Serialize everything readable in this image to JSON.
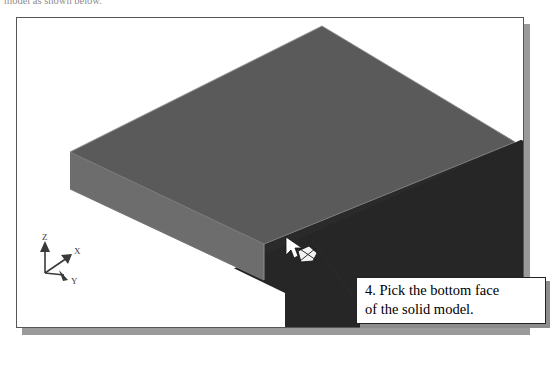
{
  "page": {
    "width": 554,
    "height": 369,
    "background": "#ffffff"
  },
  "top_caption": {
    "text": "model as shown below.",
    "note": "clipped at top edge of screenshot"
  },
  "figure": {
    "frame": {
      "border_color": "#565656",
      "background": "#ffffff",
      "shadow_color": "#9a9a9a"
    },
    "viewport_label": "3D solid model viewport"
  },
  "model": {
    "name": "rectangular solid block",
    "faces": [
      {
        "name": "top-face",
        "color": "#5a5a5a"
      },
      {
        "name": "front-left-side-face",
        "color": "#6b6b6b"
      },
      {
        "name": "front-right-side-face",
        "color": "#3a3a3a"
      },
      {
        "name": "bottom-face",
        "color": "#262626"
      },
      {
        "name": "right-end-face",
        "color": "#1a1a1a"
      }
    ],
    "edge_color": "#8c8c8c"
  },
  "selection": {
    "cursor_icon": "arrow-pointer-icon",
    "pick_icon": "face-pick-icon",
    "pick_label": "bottom face pick point"
  },
  "axis_triad": {
    "icon": "coordinate-triad-icon",
    "axes": [
      {
        "label": "Z",
        "direction": "up"
      },
      {
        "label": "X",
        "direction": "upper-right"
      },
      {
        "label": "Y",
        "direction": "lower-right"
      }
    ],
    "color": "#3a3a3a"
  },
  "callout": {
    "lines": [
      "4. Pick the bottom face",
      "of the solid model."
    ],
    "border_color": "#222222",
    "background": "#ffffff",
    "shadow_color": "#8d8d8d",
    "leader_line_color": "#2a2a2a"
  }
}
